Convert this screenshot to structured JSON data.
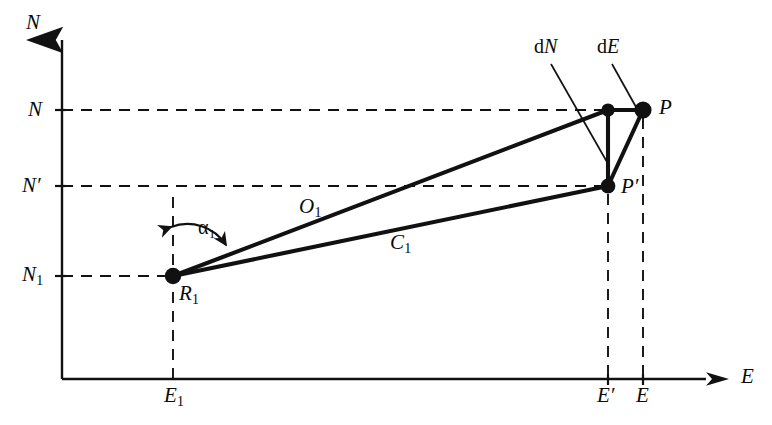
{
  "figure": {
    "kind": "coordinate-geometry-diagram",
    "background_color": "#ffffff",
    "ink_color": "#111111"
  },
  "axes": {
    "vertical_axis_label": "N",
    "horizontal_axis_label": "E",
    "origin_px": [
      62,
      379
    ],
    "vertical_axis_top_px": 34,
    "horizontal_axis_right_px": 728
  },
  "tick_labels": {
    "vertical": [
      {
        "name": "tick-n",
        "text": "N",
        "sub": "",
        "y_px": 110
      },
      {
        "name": "tick-n-prime",
        "text": "N′",
        "sub": "",
        "y_px": 186
      },
      {
        "name": "tick-n1",
        "text": "N",
        "sub": "1",
        "y_px": 276
      }
    ],
    "horizontal": [
      {
        "name": "tick-e1",
        "text": "E",
        "sub": "1",
        "x_px": 173
      },
      {
        "name": "tick-e-prime",
        "text": "E′",
        "sub": "",
        "x_px": 608
      },
      {
        "name": "tick-e",
        "text": "E",
        "sub": "",
        "x_px": 643
      }
    ]
  },
  "points": [
    {
      "name": "point-r1",
      "label": "R",
      "sub": "1",
      "x_px": 173,
      "y_px": 276
    },
    {
      "name": "point-corner",
      "label": "",
      "sub": "",
      "x_px": 608,
      "y_px": 110
    },
    {
      "name": "point-p",
      "label": "P",
      "sub": "",
      "x_px": 643,
      "y_px": 110
    },
    {
      "name": "point-p-prime",
      "label": "P′",
      "sub": "",
      "x_px": 608,
      "y_px": 186
    }
  ],
  "segments": [
    {
      "name": "segment-o1",
      "label": "O",
      "sub": "1",
      "from": "point-r1",
      "to": "point-corner",
      "label_x_px": 310,
      "label_y_px": 207
    },
    {
      "name": "segment-c1",
      "label": "C",
      "sub": "1",
      "from": "point-r1",
      "to": "point-p-prime",
      "label_x_px": 400,
      "label_y_px": 243
    },
    {
      "name": "segment-de",
      "label_prefix": "d",
      "label": "E",
      "from": "point-corner",
      "to": "point-p"
    },
    {
      "name": "segment-dn",
      "label_prefix": "d",
      "label": "N",
      "from": "point-corner",
      "to": "point-p-prime"
    }
  ],
  "annotations": {
    "angle": {
      "name": "angle-alpha1",
      "symbol": "α",
      "sub": "1",
      "at_point": "point-r1",
      "from": "vertical-dashed",
      "to": "segment-o1"
    },
    "leader_labels": [
      {
        "name": "label-dn",
        "prefix": "d",
        "italic": "N",
        "x_px": 545,
        "y_px": 48
      },
      {
        "name": "label-de",
        "prefix": "d",
        "italic": "E",
        "x_px": 608,
        "y_px": 48
      }
    ]
  },
  "dashed_guides": [
    {
      "name": "guide-n-horizontal",
      "from_px": [
        62,
        110
      ],
      "to_px": [
        604,
        110
      ]
    },
    {
      "name": "guide-n-prime-horizontal",
      "from_px": [
        62,
        186
      ],
      "to_px": [
        604,
        186
      ]
    },
    {
      "name": "guide-n1-horizontal",
      "from_px": [
        62,
        276
      ],
      "to_px": [
        168,
        276
      ]
    },
    {
      "name": "guide-e1-vertical",
      "from_px": [
        173,
        197
      ],
      "to_px": [
        173,
        379
      ]
    },
    {
      "name": "guide-e-prime-vertical",
      "from_px": [
        608,
        192
      ],
      "to_px": [
        608,
        379
      ]
    },
    {
      "name": "guide-e-vertical",
      "from_px": [
        643,
        116
      ],
      "to_px": [
        643,
        379
      ]
    }
  ]
}
